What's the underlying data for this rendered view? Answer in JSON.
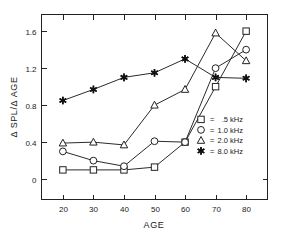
{
  "chart_data": {
    "type": "line",
    "title": "",
    "xlabel": "AGE",
    "ylabel": "Δ SPL/Δ AGE",
    "x": [
      20,
      30,
      40,
      50,
      60,
      70,
      80
    ],
    "xlim": [
      13,
      87
    ],
    "ylim": [
      -0.22,
      1.78
    ],
    "xticks": [
      "20",
      "30",
      "40",
      "50",
      "60",
      "70",
      "80"
    ],
    "yticks": [
      "0",
      "0.4",
      "0.8",
      "1.2",
      "1.6"
    ],
    "ytickvalues": [
      0,
      0.4,
      0.8,
      1.2,
      1.6
    ],
    "grid": false,
    "legend_position": "right-middle",
    "series": [
      {
        "name": ".5 kHz",
        "marker": "square-open",
        "values": [
          0.1,
          0.1,
          0.1,
          0.13,
          0.4,
          1.0,
          1.6
        ]
      },
      {
        "name": "1.0 kHz",
        "marker": "circle-open",
        "values": [
          0.3,
          0.2,
          0.14,
          0.41,
          0.4,
          1.2,
          1.4
        ]
      },
      {
        "name": "2.0 kHz",
        "marker": "triangle-open",
        "values": [
          0.39,
          0.4,
          0.37,
          0.8,
          0.97,
          1.58,
          1.28
        ]
      },
      {
        "name": "8.0 kHz",
        "marker": "star-filled",
        "values": [
          0.85,
          0.97,
          1.1,
          1.15,
          1.3,
          1.1,
          1.09
        ]
      }
    ]
  },
  "legend": {
    "equals": "=",
    "entries": [
      {
        "marker": "square-open",
        "label": ".5 kHz"
      },
      {
        "marker": "circle-open",
        "label": "1.0 kHz"
      },
      {
        "marker": "triangle-open",
        "label": "2.0 kHz"
      },
      {
        "marker": "star-filled",
        "label": "8.0 kHz"
      }
    ]
  },
  "colors": {
    "axis": "#222222",
    "line": "#2b2b2b",
    "marker_fill": "#ffffff",
    "marker_filled": "#111111",
    "background": "#ffffff"
  }
}
